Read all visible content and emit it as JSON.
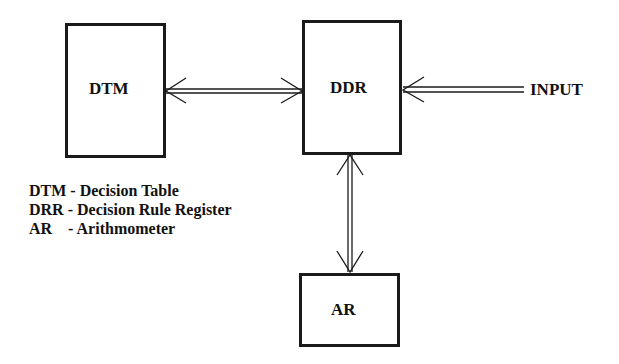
{
  "diagram": {
    "blocks": [
      {
        "id": "dtm",
        "label": "DTM"
      },
      {
        "id": "ddr",
        "label": "DDR"
      },
      {
        "id": "ar",
        "label": "AR"
      }
    ],
    "input_label": "INPUT",
    "connections": [
      {
        "from": "dtm",
        "to": "ddr",
        "type": "bidirectional-double-line"
      },
      {
        "from": "input",
        "to": "ddr",
        "type": "unidirectional-double-line"
      },
      {
        "from": "ddr",
        "to": "ar",
        "type": "bidirectional-double-line"
      }
    ],
    "legend": [
      {
        "abbr": "DTM",
        "sep": " - ",
        "meaning": "Decision Table"
      },
      {
        "abbr": "DRR",
        "sep": " - ",
        "meaning": "Decision Rule Register"
      },
      {
        "abbr": "AR ",
        "sep": "   - ",
        "meaning": "Arithmometer"
      }
    ],
    "colors": {
      "line": "#1a1a1a",
      "background": "#ffffff"
    }
  }
}
